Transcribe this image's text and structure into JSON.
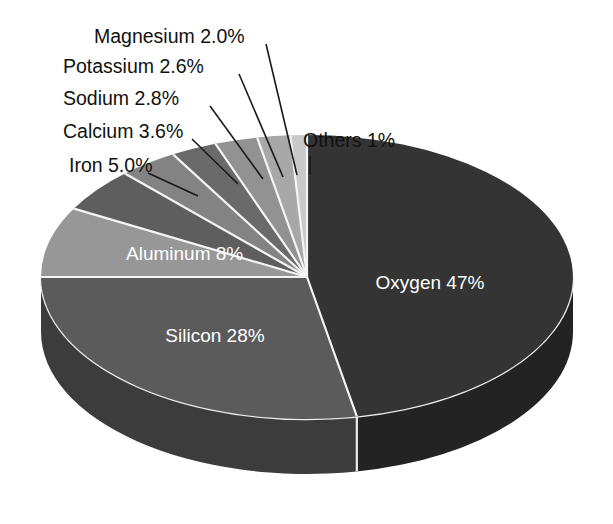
{
  "figure": {
    "background_color": "#ffffff",
    "width": 613,
    "height": 524,
    "label_text_color": "#111111",
    "inside_label_text_color": "#ffffff",
    "separator_color": "#f4f4f4",
    "leader_line_color": "#1a1a1a"
  },
  "chart_data": {
    "type": "pie",
    "title": "",
    "subtitle": "",
    "xlabel": "",
    "ylabel": "",
    "grid": false,
    "legend_position": "none",
    "style": "3d-exploded-depth",
    "start_angle_deg": 0,
    "direction": "clockwise",
    "units": "percent",
    "total": 100,
    "categories": [
      "Oxygen",
      "Silicon",
      "Aluminum",
      "Iron",
      "Calcium",
      "Sodium",
      "Potassium",
      "Magnesium",
      "Others"
    ],
    "values": [
      47,
      28,
      8,
      5.0,
      3.6,
      2.8,
      2.6,
      2.0,
      1
    ],
    "slices": [
      {
        "name": "Oxygen",
        "value": 47,
        "label": "Oxygen 47%",
        "value_label": "47%",
        "color": "#343434",
        "side_color": "#232323",
        "label_placement": "inside",
        "label_x": 430,
        "label_y": 284
      },
      {
        "name": "Silicon",
        "value": 28,
        "label": "Silicon 28%",
        "value_label": "28%",
        "color": "#5b5b5b",
        "side_color": "#3c3c3c",
        "label_placement": "inside",
        "label_x": 215,
        "label_y": 337
      },
      {
        "name": "Aluminum",
        "value": 8,
        "label": "Aluminum 8%",
        "value_label": "8%",
        "color": "#979797",
        "side_color": "#6c6c6c",
        "label_placement": "inside",
        "label_x": 126,
        "label_y": 255
      },
      {
        "name": "Iron",
        "value": 5.0,
        "label": "Iron 5.0%",
        "value_label": "5.0%",
        "color": "#5e5e5e",
        "label_placement": "outside",
        "label_x": 69,
        "label_y": 167,
        "leader": [
          [
            148,
            173
          ],
          [
            198,
            196
          ]
        ]
      },
      {
        "name": "Calcium",
        "value": 3.6,
        "label": "Calcium 3.6%",
        "value_label": "3.6%",
        "color": "#838383",
        "label_placement": "outside",
        "label_x": 63,
        "label_y": 133,
        "leader": [
          [
            192,
            139
          ],
          [
            238,
            184
          ]
        ]
      },
      {
        "name": "Sodium",
        "value": 2.8,
        "label": "Sodium 2.8%",
        "value_label": "2.8%",
        "color": "#6a6a6a",
        "label_placement": "outside",
        "label_x": 63,
        "label_y": 100,
        "leader": [
          [
            210,
            106
          ],
          [
            263,
            179
          ]
        ]
      },
      {
        "name": "Potassium",
        "value": 2.6,
        "label": "Potassium 2.6%",
        "value_label": "2.6%",
        "color": "#929292",
        "label_placement": "outside",
        "label_x": 63,
        "label_y": 68,
        "leader": [
          [
            239,
            74
          ],
          [
            283,
            177
          ]
        ]
      },
      {
        "name": "Magnesium",
        "value": 2.0,
        "label": "Magnesium 2.0%",
        "value_label": "2.0%",
        "color": "#a8a8a8",
        "label_placement": "outside",
        "label_x": 94,
        "label_y": 38,
        "leader": [
          [
            266,
            44
          ],
          [
            297,
            175
          ]
        ]
      },
      {
        "name": "Others",
        "value": 1,
        "label": "Others 1%",
        "value_label": "1%",
        "color": "#c9c9c9",
        "label_placement": "outside",
        "label_x": 303,
        "label_y": 142,
        "leader": [
          [
            310,
            156
          ],
          [
            310,
            175
          ]
        ]
      }
    ]
  }
}
